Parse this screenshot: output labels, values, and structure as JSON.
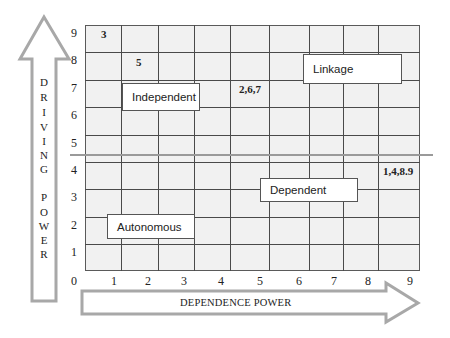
{
  "diagram": {
    "type": "MICMAC quadrant diagram",
    "y_axis": {
      "label": "DRIVING POWER",
      "letters": [
        "D",
        "R",
        "I",
        "V",
        "I",
        "N",
        "G",
        "",
        "P",
        "O",
        "W",
        "E",
        "R"
      ],
      "ticks": [
        "9",
        "8",
        "7",
        "6",
        "5",
        "4",
        "3",
        "2",
        "1",
        "0"
      ]
    },
    "x_axis": {
      "label": "DEPENDENCE POWER",
      "ticks": [
        "1",
        "2",
        "3",
        "4",
        "5",
        "6",
        "7",
        "8",
        "9"
      ]
    },
    "quadrants": {
      "independent": "Independent",
      "linkage": "Linkage",
      "dependent": "Dependent",
      "autonomous": "Autonomous"
    },
    "points": [
      {
        "label": "3",
        "x": 1,
        "y": 9
      },
      {
        "label": "5",
        "x": 2,
        "y": 8
      },
      {
        "label": "2,6,7",
        "x": 5,
        "y": 7
      },
      {
        "label": "1,4,8.9",
        "x": 9,
        "y": 4
      }
    ],
    "colors": {
      "grid_fill": "#f1f1f1",
      "grid_line": "#4a4a4a",
      "arrow_outline": "#a8a8a8",
      "separator": "#9a9a9a"
    }
  }
}
